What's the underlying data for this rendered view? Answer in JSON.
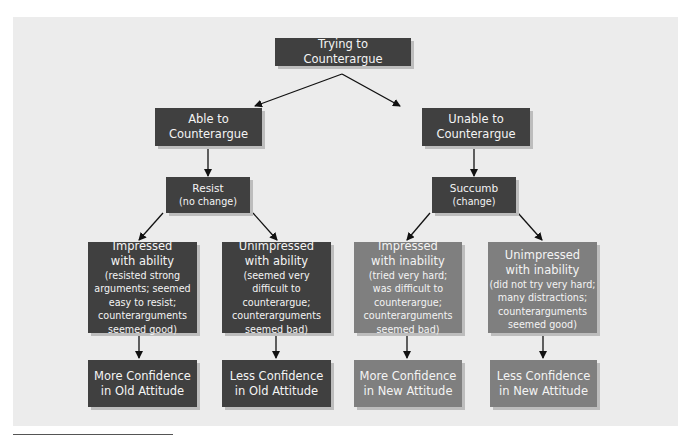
{
  "diagram": {
    "root": {
      "label": "Trying to Counterargue"
    },
    "level1": [
      {
        "label_lines": [
          "Able to",
          "Counterargue"
        ]
      },
      {
        "label_lines": [
          "Unable to",
          "Counterargue"
        ]
      }
    ],
    "level2": [
      {
        "title": "Resist",
        "subtitle": "(no change)"
      },
      {
        "title": "Succumb",
        "subtitle": "(change)"
      }
    ],
    "level3": [
      {
        "title_lines": [
          "Impressed",
          "with ability"
        ],
        "detail_lines": [
          "(resisted strong",
          "arguments; seemed",
          "easy to resist;",
          "counterarguments",
          "seemed good)"
        ]
      },
      {
        "title_lines": [
          "Unimpressed",
          "with ability"
        ],
        "detail_lines": [
          "(seemed very",
          "difficult to",
          "counterargue;",
          "counterarguments",
          "seemed bad)"
        ]
      },
      {
        "title_lines": [
          "Impressed",
          "with inability"
        ],
        "detail_lines": [
          "(tried very hard;",
          "was difficult to",
          "counterargue;",
          "counterarguments",
          "seemed bad)"
        ]
      },
      {
        "title_lines": [
          "Unimpressed",
          "with inability"
        ],
        "detail_lines": [
          "(did not try very hard;",
          "many distractions;",
          "counterarguments",
          "seemed good)"
        ]
      }
    ],
    "outcomes": [
      {
        "label_lines": [
          "More Confidence",
          "in Old Attitude"
        ]
      },
      {
        "label_lines": [
          "Less Confidence",
          "in Old Attitude"
        ]
      },
      {
        "label_lines": [
          "More Confidence",
          "in New Attitude"
        ]
      },
      {
        "label_lines": [
          "Less Confidence",
          "in New Attitude"
        ]
      }
    ]
  },
  "colors": {
    "panel_background": "#ececec",
    "dark_box": "#404040",
    "light_box": "#7f7f7f",
    "box_text": "#f4f4f4",
    "arrow": "#111111"
  }
}
